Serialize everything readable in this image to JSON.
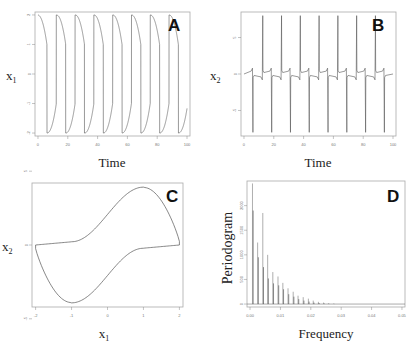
{
  "figure": {
    "panels": [
      "A",
      "B",
      "C",
      "D"
    ]
  },
  "chart_data": [
    {
      "panel": "A",
      "type": "line",
      "title": "",
      "xlabel": "Time",
      "ylabel": "x1",
      "xticks": [
        0,
        20,
        40,
        60,
        80,
        100
      ],
      "yticks": [
        -2,
        -1,
        0,
        1,
        2
      ],
      "xlim": [
        -2,
        102
      ],
      "ylim": [
        -2.1,
        2.1
      ],
      "grid": false,
      "description": "Relaxation oscillation of x1 between about +2 and -2, period about 12.6",
      "period": 12.6,
      "first_drop_time": 6.0,
      "amplitude": 2.0,
      "frame": {
        "x": 35,
        "y": 12,
        "w": 155,
        "h": 124
      }
    },
    {
      "panel": "B",
      "type": "line",
      "title": "",
      "xlabel": "Time",
      "ylabel": "x2",
      "xticks": [
        0,
        20,
        40,
        60,
        80,
        100
      ],
      "yticks": [
        -5,
        0,
        5
      ],
      "xlim": [
        -2,
        102
      ],
      "ylim": [
        -8.5,
        8.5
      ],
      "grid": false,
      "description": "Spike train of x2: sharp spikes alternating up (+8) and down (-8) near the x1 transitions, baseline near 0",
      "spikes_up_t": [
        12.6,
        25.2,
        37.8,
        50.4,
        63.0,
        75.6,
        88.2,
        100.8
      ],
      "spikes_down_t": [
        6.0,
        18.6,
        31.2,
        43.8,
        56.4,
        69.0,
        81.6,
        94.2
      ],
      "spike_height": 8.0,
      "frame": {
        "x": 241,
        "y": 12,
        "w": 155,
        "h": 124
      }
    },
    {
      "panel": "C",
      "type": "line",
      "title": "",
      "xlabel": "x1",
      "ylabel": "x2",
      "xticks": [
        -2,
        -1,
        0,
        1,
        2
      ],
      "yticks": [
        -5,
        0,
        5
      ],
      "xlim": [
        -2.1,
        2.1
      ],
      "ylim": [
        -4.2,
        4.2
      ],
      "grid": false,
      "description": "Phase portrait limit cycle (van der Pol): max x2 about 3.9 at x1=1, min x2 about -3.9 at x1=-1, flat segments near x2=0 at x1=+-2",
      "frame": {
        "x": 32,
        "y": 183,
        "w": 151,
        "h": 124
      }
    },
    {
      "panel": "D",
      "type": "bar",
      "title": "",
      "xlabel": "Frequency",
      "ylabel": "Periodogram",
      "xticks": [
        "0.00",
        "0.01",
        "0.02",
        "0.03",
        "0.04",
        "0.05"
      ],
      "yticks": [
        0,
        500,
        1000,
        1500,
        2000
      ],
      "xlim": [
        -0.001,
        0.051
      ],
      "ylim": [
        -60,
        2500
      ],
      "grid": false,
      "x": [
        0.0008,
        0.0025,
        0.0042,
        0.0058,
        0.0075,
        0.0092,
        0.0108,
        0.0125,
        0.0142,
        0.0158,
        0.0175,
        0.0192,
        0.0208,
        0.0225,
        0.0242,
        0.0258,
        0.0275
      ],
      "series": [
        {
          "name": "peaks",
          "values": [
            2450,
            1250,
            1850,
            1000,
            650,
            560,
            430,
            320,
            250,
            170,
            140,
            110,
            70,
            45,
            30,
            15,
            8
          ]
        },
        {
          "name": "secondary",
          "values": [
            1900,
            950,
            750,
            520,
            420,
            380,
            300,
            200,
            150,
            100,
            70,
            50,
            30,
            20,
            10,
            5,
            3
          ]
        }
      ],
      "frame": {
        "x": 247,
        "y": 181,
        "w": 158,
        "h": 126
      }
    }
  ],
  "labels": {
    "A": {
      "letter": "A",
      "xlabel": "Time",
      "ylabel_main": "x",
      "ylabel_sub": "1"
    },
    "B": {
      "letter": "B",
      "xlabel": "Time",
      "ylabel_main": "x",
      "ylabel_sub": "2"
    },
    "C": {
      "letter": "C",
      "xlabel_main": "x",
      "xlabel_sub": "1",
      "ylabel_main": "x",
      "ylabel_sub": "2"
    },
    "D": {
      "letter": "D",
      "xlabel": "Frequency",
      "ylabel": "Periodogram"
    }
  },
  "colors": {
    "line": "#555555",
    "frame": "#999999",
    "tick": "#888888"
  }
}
